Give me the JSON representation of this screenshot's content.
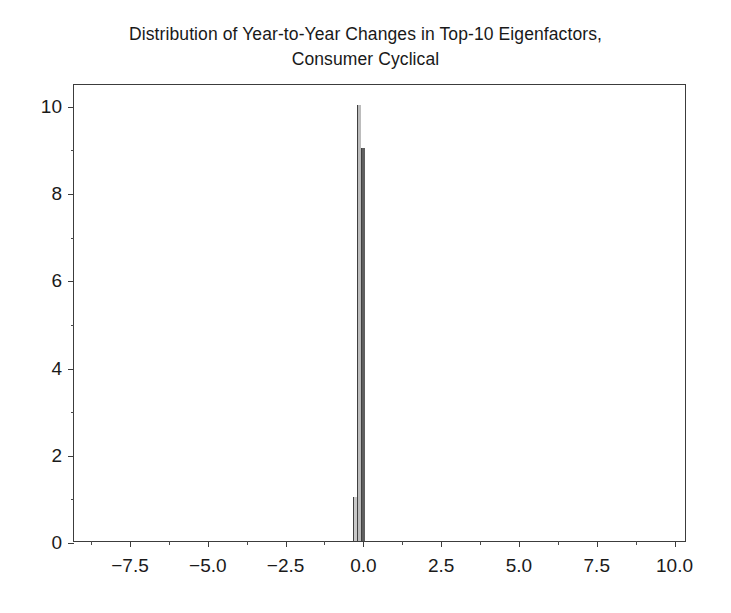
{
  "chart_data": {
    "type": "bar",
    "title": "Distribution of Year-to-Year Changes in Top-10 Eigenfactors,\nConsumer Cyclical",
    "title_line1": "Distribution of Year-to-Year Changes in Top-10 Eigenfactors,",
    "title_line2": "Consumer Cyclical",
    "xlabel": "",
    "ylabel": "",
    "xlim": [
      -9.3,
      10.4
    ],
    "ylim": [
      0.0,
      10.5
    ],
    "grid": false,
    "legend": "none",
    "bar_color": "#5a5a5a",
    "bar_edge_color": "#404040",
    "frame_color": "#3c3c3c",
    "background_color": "#ffffff",
    "xticks": [
      -7.5,
      -5.0,
      -2.5,
      0.0,
      2.5,
      5.0,
      7.5,
      10.0
    ],
    "xtick_labels": [
      "−7.5",
      "−5.0",
      "−2.5",
      "0.0",
      "2.5",
      "5.0",
      "7.5",
      "10.0"
    ],
    "yticks": [
      0,
      2,
      4,
      6,
      8,
      10
    ],
    "ytick_labels": [
      "0",
      "2",
      "4",
      "6",
      "8",
      "10"
    ],
    "xticks_minor": [
      -8.75,
      -6.25,
      -3.75,
      -1.25,
      1.25,
      3.75,
      6.25,
      8.75
    ],
    "yticks_minor": [
      1,
      3,
      5,
      7,
      9
    ],
    "bins": [
      {
        "x_left": -0.33,
        "x_right": -0.2,
        "value": 1,
        "color": "#c9c9c9"
      },
      {
        "x_left": -0.2,
        "x_right": -0.07,
        "value": 10,
        "color": "#bcbcbc"
      },
      {
        "x_left": -0.07,
        "x_right": 0.06,
        "value": 9,
        "color": "#5f5f5f"
      }
    ],
    "categories": [
      "-0.33",
      "-0.20",
      "-0.07"
    ],
    "values": [
      1,
      10,
      9
    ]
  }
}
